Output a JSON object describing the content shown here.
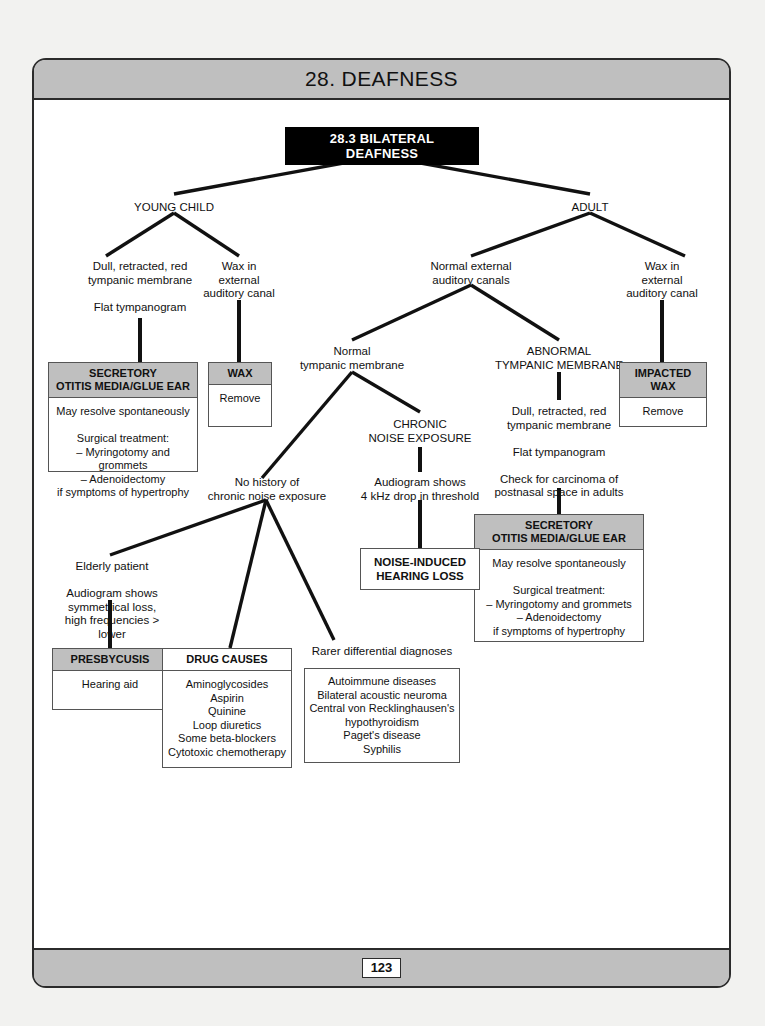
{
  "page": {
    "chapter_title": "28. DEAFNESS",
    "page_number": "123",
    "section_header": "28.3 BILATERAL DEAFNESS"
  },
  "nodes": {
    "young_child": "YOUNG CHILD",
    "adult": "ADULT",
    "dull_retracted_child": "Dull, retracted, red\ntympanic membrane\n\nFlat tympanogram",
    "wax_child": "Wax in\nexternal\nauditory canal",
    "normal_external_canals": "Normal external\nauditory canals",
    "wax_adult": "Wax in\nexternal\nauditory canal",
    "normal_tympanic_membrane": "Normal\ntympanic membrane",
    "abnormal_tympanic_membrane": "ABNORMAL\nTYMPANIC MEMBRANE",
    "chronic_noise_exposure": "CHRONIC\nNOISE EXPOSURE",
    "audiogram_4khz": "Audiogram shows\n4 kHz drop in threshold",
    "abnormal_findings": "Dull, retracted, red\ntympanic membrane\n\nFlat tympanogram\n\nCheck for carcinoma of\npostnasal space in adults",
    "no_history_noise": "No history of\nchronic noise exposure",
    "elderly_patient": "Elderly patient\n\nAudiogram shows\nsymmetrical loss,\nhigh frequencies > lower",
    "rarer_label": "Rarer differential diagnoses"
  },
  "boxes": {
    "secretory_child": {
      "header": "SECRETORY\nOTITIS MEDIA/GLUE EAR",
      "body": "May resolve spontaneously\n\nSurgical treatment:\n– Myringotomy and grommets\n– Adenoidectomy\nif symptoms of hypertrophy"
    },
    "wax": {
      "header": "WAX",
      "body": "Remove"
    },
    "impacted_wax": {
      "header": "IMPACTED WAX",
      "body": "Remove"
    },
    "secretory_adult": {
      "header": "SECRETORY\nOTITIS MEDIA/GLUE EAR",
      "body": "May resolve spontaneously\n\nSurgical treatment:\n– Myringotomy and grommets\n– Adenoidectomy\nif symptoms of hypertrophy"
    },
    "noise_induced": {
      "label": "NOISE-INDUCED\nHEARING LOSS"
    },
    "presbycusis": {
      "header": "PRESBYCUSIS",
      "body": "Hearing aid"
    },
    "drug_causes": {
      "header": "DRUG CAUSES",
      "body": "Aminoglycosides\nAspirin\nQuinine\nLoop diuretics\nSome beta-blockers\nCytotoxic chemotherapy"
    },
    "rarer_diagnoses": {
      "body": "Autoimmune diseases\nBilateral acoustic neuroma\nCentral von Recklinghausen's\nhypothyroidism\nPaget's disease\nSyphilis"
    }
  },
  "colors": {
    "header_gray": "#bfbfbf",
    "frame": "#2b2b2b",
    "section_header_bg": "#000000",
    "page_bg": "#f2f2f0"
  }
}
